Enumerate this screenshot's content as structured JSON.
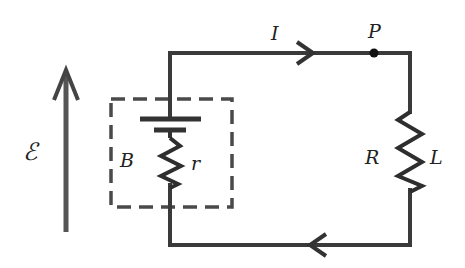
{
  "diagram": {
    "type": "circuit",
    "labels": {
      "emf": "ℰ",
      "current": "I",
      "point": "P",
      "battery": "B",
      "internal_resistance": "r",
      "load_resistance": "R",
      "inductance": "L"
    },
    "colors": {
      "wire": "#3a3a3a",
      "background": "#ffffff"
    },
    "components": [
      {
        "id": "battery",
        "label": "B",
        "enclosed_in_dashed_box": true
      },
      {
        "id": "internal-resistor",
        "label": "r"
      },
      {
        "id": "load-resistor",
        "labels": [
          "R",
          "L"
        ]
      },
      {
        "id": "junction-point",
        "label": "P"
      },
      {
        "id": "emf-arrow",
        "label": "ℰ",
        "direction": "up"
      },
      {
        "id": "current-arrow-top",
        "label": "I",
        "direction": "right"
      },
      {
        "id": "current-arrow-bottom",
        "direction": "left"
      }
    ]
  }
}
